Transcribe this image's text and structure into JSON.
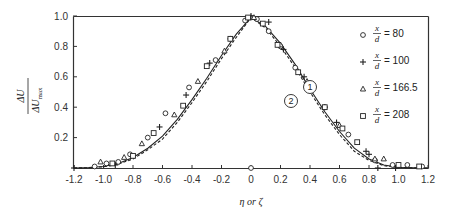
{
  "chart_data": {
    "type": "scatter",
    "title": "",
    "xlabel": "η or ζ",
    "ylabel": "ΔU / ΔU_max",
    "ylabel_parts": {
      "num": "ΔU",
      "den": "ΔU",
      "den_sub": "max"
    },
    "xlim": [
      -1.2,
      1.2
    ],
    "ylim": [
      0,
      1.0
    ],
    "xticks": [
      -1.2,
      -1.0,
      -0.8,
      -0.6,
      -0.4,
      -0.2,
      0,
      0.2,
      0.4,
      0.6,
      0.8,
      1.0,
      1.2
    ],
    "xtick_labels": [
      "-1.2",
      "-1.0",
      "-0.8",
      "-0.6",
      "-0.4",
      "-0.2",
      "0",
      "0.2",
      "0.4",
      "0.6",
      "0.8",
      "1.0",
      "1.2"
    ],
    "yticks": [
      0.2,
      0.4,
      0.6,
      0.8,
      1.0
    ],
    "ytick_labels": [
      "0.2",
      "0.4",
      "0.6",
      "0.8",
      "1.0"
    ],
    "grid": false,
    "legend_position": "upper right",
    "legend": [
      {
        "marker": "circle",
        "symbol": "o",
        "var": "x",
        "den": "d",
        "value": "80"
      },
      {
        "marker": "plus",
        "symbol": "+",
        "var": "x",
        "den": "d",
        "value": "100"
      },
      {
        "marker": "triangle",
        "symbol": "Δ",
        "var": "x",
        "den": "d",
        "value": "166.5"
      },
      {
        "marker": "square",
        "symbol": "□",
        "var": "x",
        "den": "d",
        "value": "208"
      }
    ],
    "curves": [
      {
        "name": "1",
        "style": "solid",
        "x": [
          -1.2,
          -1.1,
          -1.0,
          -0.9,
          -0.8,
          -0.7,
          -0.6,
          -0.5,
          -0.4,
          -0.3,
          -0.2,
          -0.1,
          0,
          0.1,
          0.2,
          0.3,
          0.4,
          0.5,
          0.6,
          0.7,
          0.8,
          0.9,
          1.0,
          1.1,
          1.2
        ],
        "y": [
          0,
          0.003,
          0.01,
          0.03,
          0.07,
          0.13,
          0.21,
          0.32,
          0.45,
          0.59,
          0.74,
          0.88,
          0.99,
          0.93,
          0.82,
          0.68,
          0.52,
          0.37,
          0.24,
          0.13,
          0.06,
          0.02,
          0.005,
          0.002,
          0
        ]
      },
      {
        "name": "2",
        "style": "dashed",
        "x": [
          -1.2,
          -1.1,
          -1.0,
          -0.9,
          -0.8,
          -0.7,
          -0.6,
          -0.5,
          -0.4,
          -0.3,
          -0.2,
          -0.1,
          0,
          0.1,
          0.2,
          0.3,
          0.4,
          0.5,
          0.6,
          0.7,
          0.8,
          0.9,
          1.0,
          1.1,
          1.2
        ],
        "y": [
          0,
          0.002,
          0.008,
          0.025,
          0.06,
          0.12,
          0.19,
          0.3,
          0.43,
          0.57,
          0.72,
          0.86,
          0.99,
          0.92,
          0.8,
          0.66,
          0.5,
          0.35,
          0.22,
          0.11,
          0.05,
          0.015,
          0.004,
          0.001,
          0
        ]
      }
    ],
    "series": [
      {
        "name": "x/d = 80",
        "marker": "circle",
        "x": [
          -1.06,
          -0.98,
          -0.9,
          -0.82,
          -0.7,
          -0.58,
          -0.42,
          -0.24,
          -0.14,
          -0.04,
          0,
          0.04,
          0.12,
          0.2,
          0.3,
          0.5,
          0.66,
          0.84,
          0.96,
          1.06,
          1.16,
          0
        ],
        "y": [
          0.01,
          0.03,
          0.04,
          0.09,
          0.2,
          0.36,
          0.53,
          0.71,
          0.85,
          0.97,
          0.99,
          0.98,
          0.9,
          0.8,
          0.66,
          0.4,
          0.22,
          0.05,
          0.02,
          0.02,
          0.01,
          0
        ]
      },
      {
        "name": "x/d = 100",
        "marker": "plus",
        "x": [
          -1.2,
          -0.92,
          -0.62,
          -0.44,
          -0.28,
          0,
          0.12,
          0.22,
          0.36,
          0.5,
          0.58,
          0.78,
          0.8,
          0.86,
          0.98
        ],
        "y": [
          0,
          0.02,
          0.27,
          0.48,
          0.69,
          1.0,
          0.96,
          0.78,
          0.6,
          0.4,
          0.3,
          0.11,
          0.09,
          0.0,
          0.0
        ]
      },
      {
        "name": "x/d = 166.5",
        "marker": "triangle",
        "x": [
          -1.02,
          -0.86,
          -0.74,
          -0.52,
          -0.36,
          -0.18,
          0.02,
          0.2,
          0.38,
          0.6,
          0.84,
          0.9
        ],
        "y": [
          0.04,
          0.07,
          0.16,
          0.35,
          0.57,
          0.77,
          0.99,
          0.81,
          0.57,
          0.28,
          0.06,
          0.06
        ]
      },
      {
        "name": "x/d = 208",
        "marker": "square",
        "x": [
          -0.94,
          -0.8,
          -0.66,
          -0.46,
          -0.3,
          -0.14,
          -0.02,
          0.08,
          0.18,
          0.32,
          0.5,
          0.62,
          0.72,
          1.0,
          1.14
        ],
        "y": [
          0.03,
          0.08,
          0.23,
          0.41,
          0.67,
          0.85,
          0.99,
          0.95,
          0.81,
          0.63,
          0.4,
          0.26,
          0.17,
          0.02,
          0.01
        ]
      }
    ],
    "annotations": [
      {
        "label": "1",
        "x": 0.5,
        "y": 0.55,
        "shape": "circle"
      },
      {
        "label": "2",
        "x": 0.4,
        "y": 0.48,
        "shape": "circle"
      }
    ]
  }
}
